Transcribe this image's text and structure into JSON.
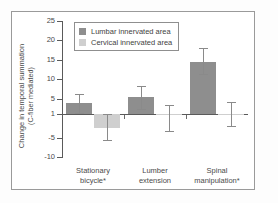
{
  "chart_data": {
    "type": "bar",
    "title": "",
    "subtitle": "",
    "xlabel": "",
    "ylabel_line1": "Change in temporal summation",
    "ylabel_line2": "(C-fiber mediated)",
    "categories": [
      "Stationary bicycle*",
      "Lumber extension",
      "Spinal manipulation*"
    ],
    "category_lines": [
      {
        "l1": "Stationary",
        "l2": "bicycle*"
      },
      {
        "l1": "Lumber",
        "l2": "extension"
      },
      {
        "l1": "Spinal",
        "l2": "manipulation*"
      }
    ],
    "ylim": [
      -10,
      25
    ],
    "yticks": [
      25,
      20,
      15,
      10,
      5,
      1,
      -5,
      -10
    ],
    "ytick_labels": [
      "25",
      "20",
      "15",
      "10",
      "5",
      "1",
      "-5",
      "-10"
    ],
    "baseline_value": 1,
    "grid": false,
    "legend_position": "top-left",
    "series": [
      {
        "name": "Lumbar innervated area",
        "color": "#8e8e8e",
        "values": [
          3.8,
          5.4,
          14.5
        ],
        "err_low": [
          1.2,
          2.3,
          11.3
        ],
        "err_high": [
          6.3,
          8.3,
          18.0
        ]
      },
      {
        "name": "Cervical innervated area",
        "color": "#cfcfcf",
        "values": [
          -2.5,
          0.8,
          1.0
        ],
        "err_low": [
          -5.7,
          -3.3,
          -2.0
        ],
        "err_high": [
          1.0,
          3.5,
          4.2
        ]
      }
    ],
    "annotations": [
      "* indicates significance"
    ]
  },
  "legend": {
    "items": [
      {
        "label": "Lumbar innervated area",
        "color": "#8e8e8e"
      },
      {
        "label": "Cervical innervated area",
        "color": "#cfcfcf"
      }
    ]
  },
  "colors": {
    "lumbar": "#8e8e8e",
    "cervical": "#cfcfcf",
    "axis": "#5a5a5a",
    "frame": "#9a9a9a",
    "text": "#4a4a4a",
    "background": "#ffffff"
  }
}
